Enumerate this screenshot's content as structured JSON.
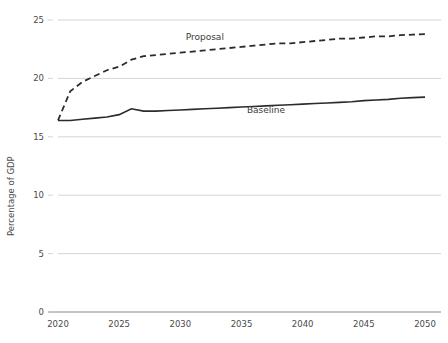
{
  "chart_data": {
    "type": "line",
    "title": "",
    "subtitle": "",
    "xlabel": "",
    "ylabel": "Percentage of GDP",
    "xlim": [
      2020,
      2050
    ],
    "ylim": [
      0,
      25
    ],
    "grid": true,
    "legend_position": "inline-labels",
    "x_ticks": [
      "2020",
      "2025",
      "2030",
      "2035",
      "2040",
      "2045",
      "2050"
    ],
    "y_ticks": [
      "0",
      "5",
      "10",
      "15",
      "20",
      "25"
    ],
    "x": [
      2020,
      2021,
      2022,
      2023,
      2024,
      2025,
      2026,
      2027,
      2028,
      2029,
      2030,
      2031,
      2032,
      2033,
      2034,
      2035,
      2036,
      2037,
      2038,
      2039,
      2040,
      2041,
      2042,
      2043,
      2044,
      2045,
      2046,
      2047,
      2048,
      2049,
      2050
    ],
    "series": [
      {
        "name": "Proposal",
        "style": "dashed",
        "color": "#2b2b2b",
        "label_x": 2032,
        "label_y": 23.3,
        "values": [
          16.4,
          18.9,
          19.7,
          20.2,
          20.7,
          21.0,
          21.6,
          21.9,
          22.0,
          22.1,
          22.2,
          22.3,
          22.4,
          22.5,
          22.6,
          22.7,
          22.8,
          22.9,
          23.0,
          23.0,
          23.1,
          23.2,
          23.3,
          23.4,
          23.4,
          23.5,
          23.6,
          23.6,
          23.7,
          23.75,
          23.8
        ]
      },
      {
        "name": "Baseline",
        "style": "solid",
        "color": "#2b2b2b",
        "label_x": 2037,
        "label_y": 17.0,
        "values": [
          16.4,
          16.4,
          16.5,
          16.6,
          16.7,
          16.9,
          17.4,
          17.2,
          17.2,
          17.25,
          17.3,
          17.35,
          17.4,
          17.45,
          17.5,
          17.55,
          17.6,
          17.65,
          17.7,
          17.75,
          17.8,
          17.85,
          17.9,
          17.95,
          18.0,
          18.1,
          18.15,
          18.2,
          18.3,
          18.35,
          18.4
        ]
      }
    ]
  }
}
